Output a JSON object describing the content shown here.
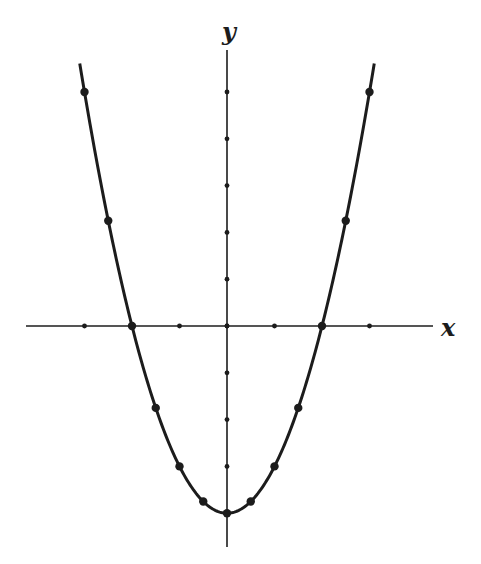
{
  "chart_data": {
    "type": "line",
    "title": "",
    "equation": "y = x^2 - 4",
    "xlabel": "x",
    "ylabel": "y",
    "xlim": [
      -4.2,
      4.3
    ],
    "ylim": [
      -4.7,
      6.1
    ],
    "x_ticks": [
      -3,
      -2,
      -1,
      0,
      1,
      2,
      3
    ],
    "y_ticks": [
      -3,
      -2,
      -1,
      0,
      1,
      2,
      3,
      4,
      5
    ],
    "tick_labels_shown": false,
    "grid": false,
    "legend": null,
    "curve_x_range": [
      -3.1,
      3.1
    ],
    "series": [
      {
        "name": "y = x^2 - 4",
        "x": [
          -3,
          -2.5,
          -2,
          -1.5,
          -1,
          -0.5,
          0,
          0.5,
          1,
          1.5,
          2,
          2.5,
          3
        ],
        "values": [
          5,
          2.25,
          0,
          -1.75,
          -3,
          -3.75,
          -4,
          -3.75,
          -3,
          -1.75,
          0,
          2.25,
          5
        ]
      }
    ]
  },
  "colors": {
    "background": "#ffffff",
    "ink": "#1c1c1c"
  },
  "layout": {
    "origin_px": [
      227,
      326
    ],
    "unit_x_px": 47.5,
    "unit_y_px": 46.8,
    "x_axis_px": [
      26,
      433
    ],
    "y_axis_px": [
      50,
      547
    ],
    "xlabel_pos": [
      441,
      336
    ],
    "ylabel_pos": [
      222,
      40
    ]
  }
}
